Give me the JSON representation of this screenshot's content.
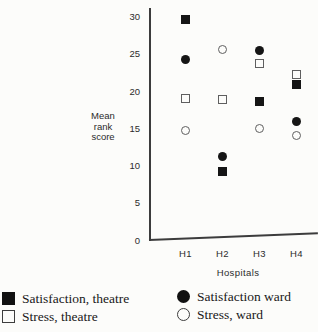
{
  "chart_data": {
    "type": "scatter",
    "categories": [
      "H1",
      "H2",
      "H3",
      "H4"
    ],
    "series": [
      {
        "name": "Satisfaction, theatre",
        "marker": "filled-square",
        "values": [
          29.6,
          9.3,
          18.7,
          20.9
        ]
      },
      {
        "name": "Stress, theatre",
        "marker": "open-square",
        "values": [
          19.0,
          18.9,
          23.7,
          22.3
        ]
      },
      {
        "name": "Satisfaction ward",
        "marker": "filled-circle",
        "values": [
          24.3,
          11.3,
          25.5,
          16.0
        ]
      },
      {
        "name": "Stress, ward",
        "marker": "open-circle",
        "values": [
          14.7,
          25.7,
          15.0,
          14.1
        ]
      }
    ],
    "title": "",
    "xlabel": "Hospitals",
    "ylabel": "Mean rank score",
    "ylim": [
      0,
      30
    ],
    "yticks": [
      0,
      5,
      10,
      15,
      20,
      25,
      30
    ],
    "grid": false,
    "legend_position": "bottom"
  },
  "colors": {
    "background": "#fcfcfa",
    "ink": "#151515",
    "axis": "#3c3c3c",
    "open_marker_stroke": "#5f5f5f"
  }
}
